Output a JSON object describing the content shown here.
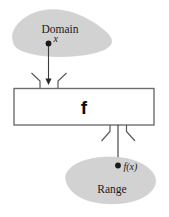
{
  "diagram": {
    "colors": {
      "blob_fill": "#d2d2d2",
      "blob_stroke": "#c8c8c8",
      "box_fill": "#ffffff",
      "box_stroke": "#6e6e6e",
      "line": "#3a3a3a",
      "text": "#1a1a1a",
      "background": "#ffffff"
    },
    "domain": {
      "label": "Domain",
      "point_label": "x"
    },
    "machine": {
      "label": "f"
    },
    "range": {
      "label": "Range",
      "point_label": "f(x)"
    }
  }
}
